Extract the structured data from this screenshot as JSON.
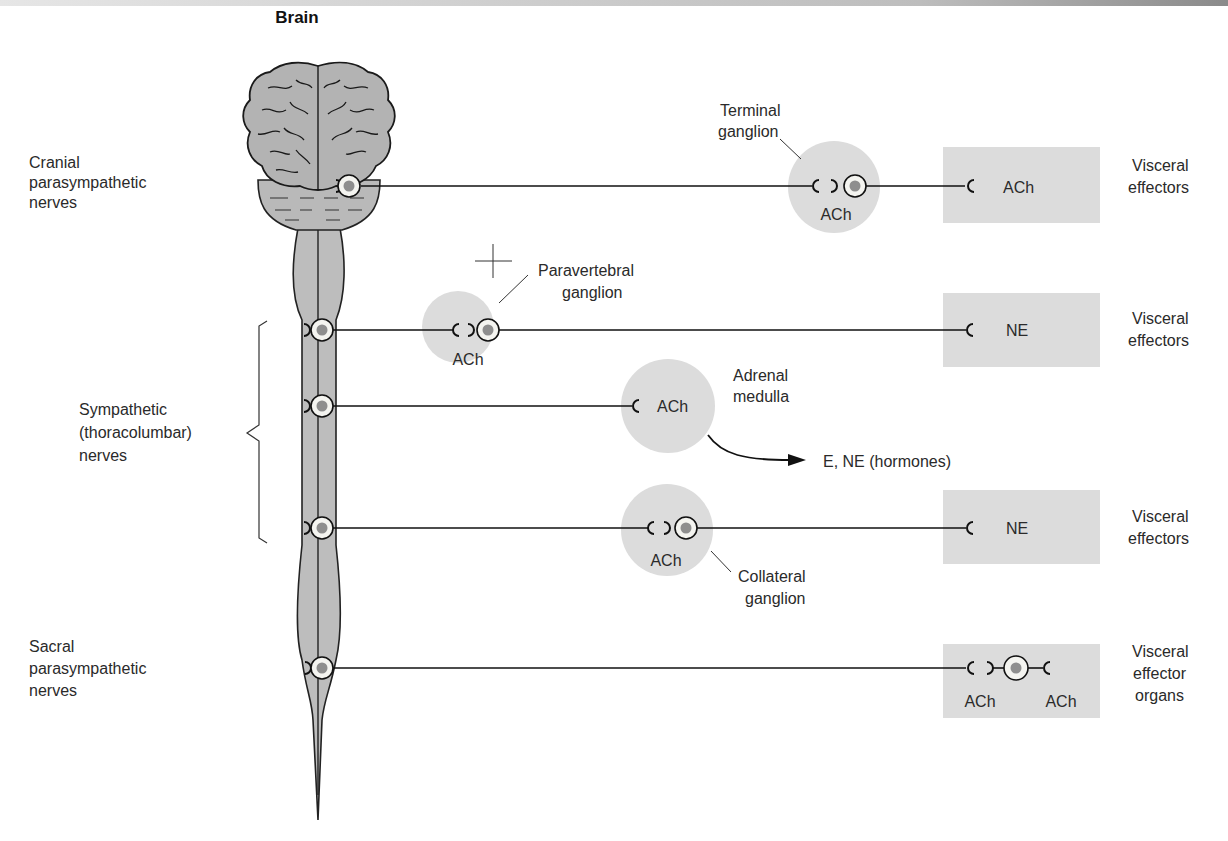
{
  "title": "Brain",
  "colors": {
    "ganglion_fill": "#dcdcdc",
    "effector_fill": "#dcdcdc",
    "cns_fill": "#bdbdbd",
    "nucleus": "#8e8e8e",
    "line": "#111111"
  },
  "left_labels": {
    "cranial": [
      "Cranial",
      "parasympathetic",
      "nerves"
    ],
    "sympathetic": [
      "Sympathetic",
      "(thoracolumbar)",
      "nerves"
    ],
    "sacral": [
      "Sacral",
      "parasympathetic",
      "nerves"
    ]
  },
  "rows": [
    {
      "id": "cranial",
      "ganglion_label": [
        "Terminal",
        "ganglion"
      ],
      "ganglion_transmitter": "ACh",
      "effector_transmitter": "ACh",
      "effector_label": [
        "Visceral",
        "effectors"
      ]
    },
    {
      "id": "sympathetic-paravertebral",
      "ganglion_label": [
        "Paravertebral",
        "ganglion"
      ],
      "ganglion_transmitter": "ACh",
      "effector_transmitter": "NE",
      "effector_label": [
        "Visceral",
        "effectors"
      ]
    },
    {
      "id": "sympathetic-adrenal",
      "organ_label": [
        "Adrenal",
        "medulla"
      ],
      "organ_transmitter": "ACh",
      "output_label": "E, NE (hormones)"
    },
    {
      "id": "sympathetic-collateral",
      "ganglion_label": [
        "Collateral",
        "ganglion"
      ],
      "ganglion_transmitter": "ACh",
      "effector_transmitter": "NE",
      "effector_label": [
        "Visceral",
        "effectors"
      ]
    },
    {
      "id": "sacral",
      "effector_transmitters": [
        "ACh",
        "ACh"
      ],
      "effector_label": [
        "Visceral",
        "effector",
        "organs"
      ]
    }
  ]
}
